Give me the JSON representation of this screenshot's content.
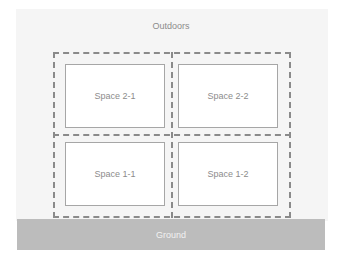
{
  "diagram": {
    "outdoors_label": "Outdoors",
    "ground_label": "Ground",
    "spaces": [
      {
        "id": "2-1",
        "label": "Space 2-1",
        "floor": 2,
        "position": "left"
      },
      {
        "id": "2-2",
        "label": "Space 2-2",
        "floor": 2,
        "position": "right"
      },
      {
        "id": "1-1",
        "label": "Space 1-1",
        "floor": 1,
        "position": "left"
      },
      {
        "id": "1-2",
        "label": "Space 1-2",
        "floor": 1,
        "position": "right"
      }
    ],
    "colors": {
      "background": "#f5f5f5",
      "dashed_border": "#8a8a8a",
      "space_fill": "#ffffff",
      "space_border": "#a6a6a6",
      "ground_fill": "#bcbcbc",
      "label_text": "#8c8c8c",
      "ground_text": "#f2f2f2"
    }
  }
}
